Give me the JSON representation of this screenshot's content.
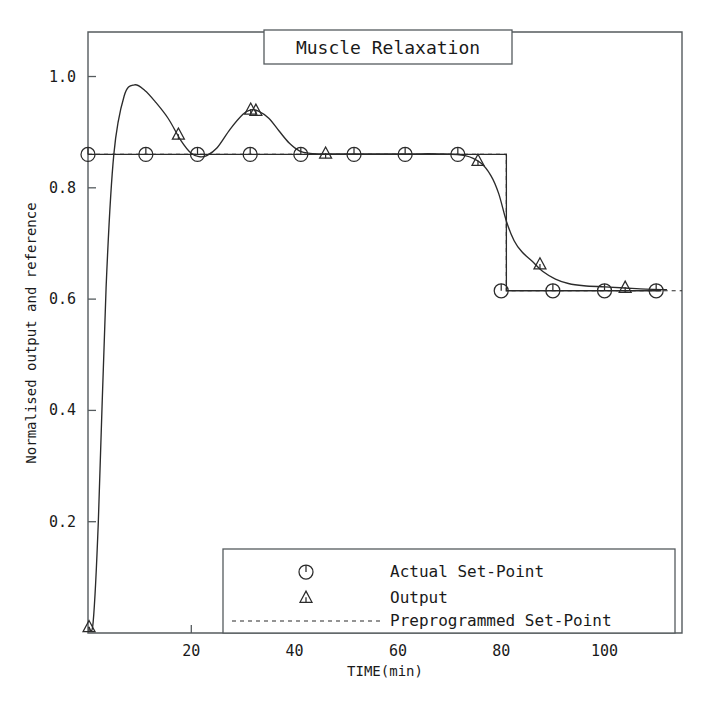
{
  "chart_data": {
    "type": "line",
    "title": "Muscle Relaxation",
    "xlabel": "TIME(min)",
    "ylabel": "Normalised output and reference",
    "xlim": [
      0,
      115
    ],
    "ylim": [
      0,
      1.08
    ],
    "grid": false,
    "legend_position": "bottom-center",
    "xticks": [
      20,
      40,
      60,
      80,
      100
    ],
    "xtick_labels": [
      "20",
      "40",
      "60",
      "80",
      "100"
    ],
    "yticks": [
      0.2,
      0.4,
      0.6,
      0.8,
      1.0
    ],
    "ytick_labels": [
      "0.2",
      "0.4",
      "0.6",
      "0.8",
      "1.0"
    ],
    "series": [
      {
        "name": "Actual Set-Point",
        "marker": "circle-with-stem",
        "style": "solid",
        "x": [
          0,
          11,
          21,
          31,
          41,
          51,
          61,
          71,
          81,
          81,
          91,
          101,
          111
        ],
        "values": [
          0.86,
          0.86,
          0.86,
          0.86,
          0.86,
          0.86,
          0.86,
          0.86,
          0.86,
          0.615,
          0.615,
          0.615,
          0.615
        ],
        "marker_x": [
          0,
          11.2,
          21.2,
          31.4,
          41.2,
          51.5,
          61.4,
          71.6,
          80.0,
          90.0,
          100.0,
          110.0
        ],
        "marker_y": [
          0.86,
          0.86,
          0.86,
          0.86,
          0.86,
          0.86,
          0.86,
          0.86,
          0.615,
          0.615,
          0.615,
          0.615
        ]
      },
      {
        "name": "Output",
        "marker": "triangle-with-stem",
        "style": "solid",
        "x": [
          0.2,
          1.0,
          2.0,
          3.5,
          5.0,
          7.0,
          9.0,
          11.0,
          13.0,
          15.5,
          18.0,
          20.0,
          21.5,
          23.0,
          25.0,
          27.5,
          30.0,
          31.5,
          33.0,
          35.0,
          37.0,
          39.0,
          41.0,
          43.0,
          46.0,
          50.0,
          56.0,
          62.0,
          68.0,
          73.0,
          76.0,
          78.0,
          79.5,
          81.0,
          82.5,
          84.0,
          86.0,
          88.0,
          90.5,
          93.0,
          96.0,
          100.0,
          104.0,
          108.0,
          112.0
        ],
        "values": [
          0.01,
          0.02,
          0.2,
          0.62,
          0.86,
          0.965,
          0.985,
          0.975,
          0.955,
          0.925,
          0.885,
          0.862,
          0.856,
          0.858,
          0.872,
          0.905,
          0.932,
          0.94,
          0.938,
          0.925,
          0.902,
          0.88,
          0.866,
          0.862,
          0.861,
          0.861,
          0.861,
          0.861,
          0.861,
          0.858,
          0.845,
          0.822,
          0.79,
          0.74,
          0.705,
          0.685,
          0.668,
          0.65,
          0.636,
          0.628,
          0.624,
          0.622,
          0.62,
          0.618,
          0.617
        ],
        "marker_x": [
          0.2,
          17.5,
          31.5,
          32.5,
          46.0,
          75.5,
          87.5,
          104.0
        ],
        "marker_y": [
          0.01,
          0.895,
          0.94,
          0.938,
          0.861,
          0.848,
          0.662,
          0.62
        ]
      },
      {
        "name": "Preprogrammed Set-Point",
        "marker": "none",
        "style": "dashed",
        "x": [
          0,
          81,
          81,
          115
        ],
        "values": [
          0.86,
          0.86,
          0.615,
          0.615
        ]
      }
    ],
    "legend": [
      {
        "label": "Actual Set-Point",
        "marker": "circle-with-stem"
      },
      {
        "label": "Output",
        "marker": "triangle-with-stem"
      },
      {
        "label": "Preprogrammed Set-Point",
        "marker": "dashed-line"
      }
    ]
  }
}
